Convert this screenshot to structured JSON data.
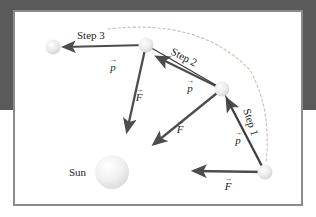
{
  "figure": {
    "title_alt": "Orbital momentum-impulse step diagram",
    "background_color": "#5a5a5a",
    "panel_color": "#ffffff",
    "panel_border_color": "#8a8a8a",
    "arrow_color": "#4d4d4d",
    "arrow_dark_color": "#3a3a3a",
    "orbit_dash_color": "#c9bfae",
    "body_fill": "#e8e8e8",
    "sun_fill": "#eeeeee"
  },
  "labels": {
    "sun": "Sun",
    "step1": "Step 1",
    "step2": "Step 2",
    "step3": "Step 3",
    "momentum": "p",
    "force": "F",
    "vector_arrow": "→"
  },
  "bodies": [
    {
      "name": "planet-step3-end",
      "cx": 53,
      "cy": 47,
      "r": 7.5
    },
    {
      "name": "planet-step3-start",
      "cx": 146,
      "cy": 45,
      "r": 7.5
    },
    {
      "name": "planet-step2-start",
      "cx": 222,
      "cy": 89,
      "r": 7.5
    },
    {
      "name": "planet-step1-start",
      "cx": 265,
      "cy": 172,
      "r": 7.5
    },
    {
      "name": "sun",
      "cx": 112,
      "cy": 172,
      "r": 17
    }
  ],
  "vectors": [
    {
      "name": "momentum-step3",
      "label": "p",
      "x1": 146,
      "y1": 45,
      "x2": 62,
      "y2": 47
    },
    {
      "name": "force-step3",
      "label": "F",
      "x1": 146,
      "y1": 45,
      "x2": 126,
      "y2": 133
    },
    {
      "name": "momentum-step2",
      "label": "p",
      "x1": 222,
      "y1": 89,
      "x2": 155,
      "y2": 56
    },
    {
      "name": "force-step2",
      "label": "F",
      "x1": 222,
      "y1": 89,
      "x2": 152,
      "y2": 146
    },
    {
      "name": "momentum-step1",
      "label": "p",
      "x1": 265,
      "y1": 172,
      "x2": 225,
      "y2": 96
    },
    {
      "name": "force-step1",
      "label": "F",
      "x1": 265,
      "y1": 172,
      "x2": 192,
      "y2": 171
    }
  ],
  "vector_label_positions": [
    {
      "name": "momentum-step3-label",
      "x": 114,
      "y": 66
    },
    {
      "name": "force-step3-label",
      "x": 137,
      "y": 100
    },
    {
      "name": "momentum-step2-label",
      "x": 190,
      "y": 92
    },
    {
      "name": "force-step2-label",
      "x": 178,
      "y": 133
    },
    {
      "name": "momentum-step1-label",
      "x": 238,
      "y": 143
    },
    {
      "name": "force-step1-label",
      "x": 228,
      "y": 190
    }
  ],
  "step_label_positions": [
    {
      "name": "step3-label",
      "x": 77,
      "y": 39,
      "rotate": 0
    },
    {
      "name": "step2-label",
      "x": 170,
      "y": 52,
      "rotate": 27
    },
    {
      "name": "step1-label",
      "x": 245,
      "y": 112,
      "rotate": 72
    }
  ],
  "orbit_arc": {
    "name": "dashed-orbit-arc",
    "path": "M 108 29 Q 200 18 250 70 Q 272 110 266 162"
  }
}
